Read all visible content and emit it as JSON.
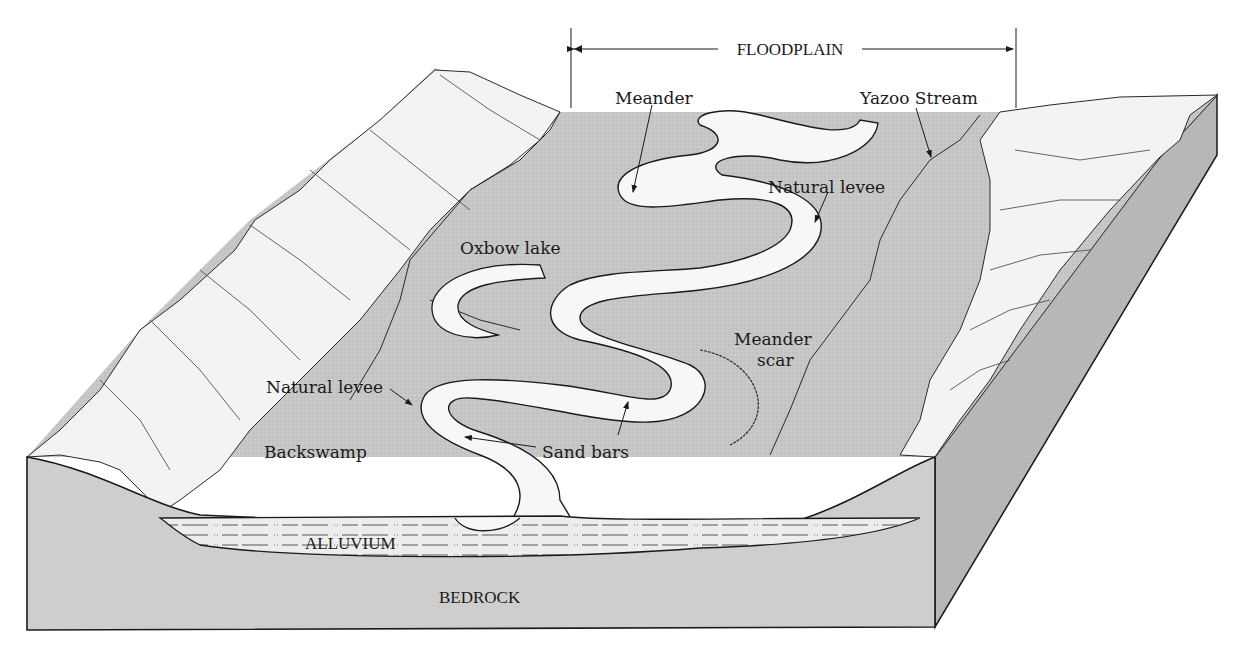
{
  "diagram": {
    "colors": {
      "floodplain": "#c9c9c9",
      "hills": "#f2f2f2",
      "river": "#f7f7f7",
      "front_face": "#d4d4d4",
      "side_face": "#bdbdbd",
      "alluvium": "#ececec",
      "outline": "#1a1a1a"
    },
    "dimension": {
      "label": "FLOODPLAIN"
    },
    "labels": {
      "meander": "Meander",
      "yazoo_stream": "Yazoo Stream",
      "natural_levee_top": "Natural levee",
      "oxbow_lake": "Oxbow lake",
      "meander_scar_line1": "Meander",
      "meander_scar_line2": "scar",
      "natural_levee_left": "Natural levee",
      "backswamp": "Backswamp",
      "sand_bars": "Sand bars",
      "alluvium": "ALLUVIUM",
      "bedrock": "BEDROCK"
    }
  }
}
